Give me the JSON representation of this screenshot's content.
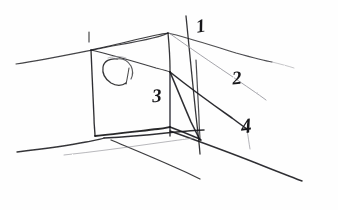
{
  "drawing": {
    "title": "Hand-drawn perspective sketch of a box on a ground plane",
    "medium": "pencil sketch",
    "background_color": "#fefefe",
    "ink_color": "#1a1a1d",
    "faint_ink_color": "#9a9aa0",
    "width": 338,
    "height": 210
  },
  "labels": [
    {
      "id": "label-1",
      "text": "1",
      "x": 196,
      "y": 16
    },
    {
      "id": "label-2",
      "text": "2",
      "x": 232,
      "y": 68
    },
    {
      "id": "label-3",
      "text": "3",
      "x": 152,
      "y": 86
    },
    {
      "id": "label-4",
      "text": "4",
      "x": 241,
      "y": 116
    }
  ],
  "shapes": {
    "box_front_face": "quadrilateral front face of the cuboid",
    "box_top_face": "receding top face of the cuboid",
    "box_right_face": "narrow right side face of the cuboid",
    "blob": "small hook-shaped scribble on the front face",
    "tick_mark": "short vertical tick above the upper-left vertical edge",
    "horizon_line_upper": "long near-horizontal construction line crossing the upper area",
    "ground_line_lower": "long near-horizontal construction line crossing the lower area",
    "vanishing_ray_1": "steep construction line passing label 1",
    "vanishing_ray_2": "faint diagonal construction line passing label 2",
    "vanishing_ray_4": "diagonal construction line passing label 4",
    "ground_ray_left": "diagonal ray running down-left from the box base"
  }
}
